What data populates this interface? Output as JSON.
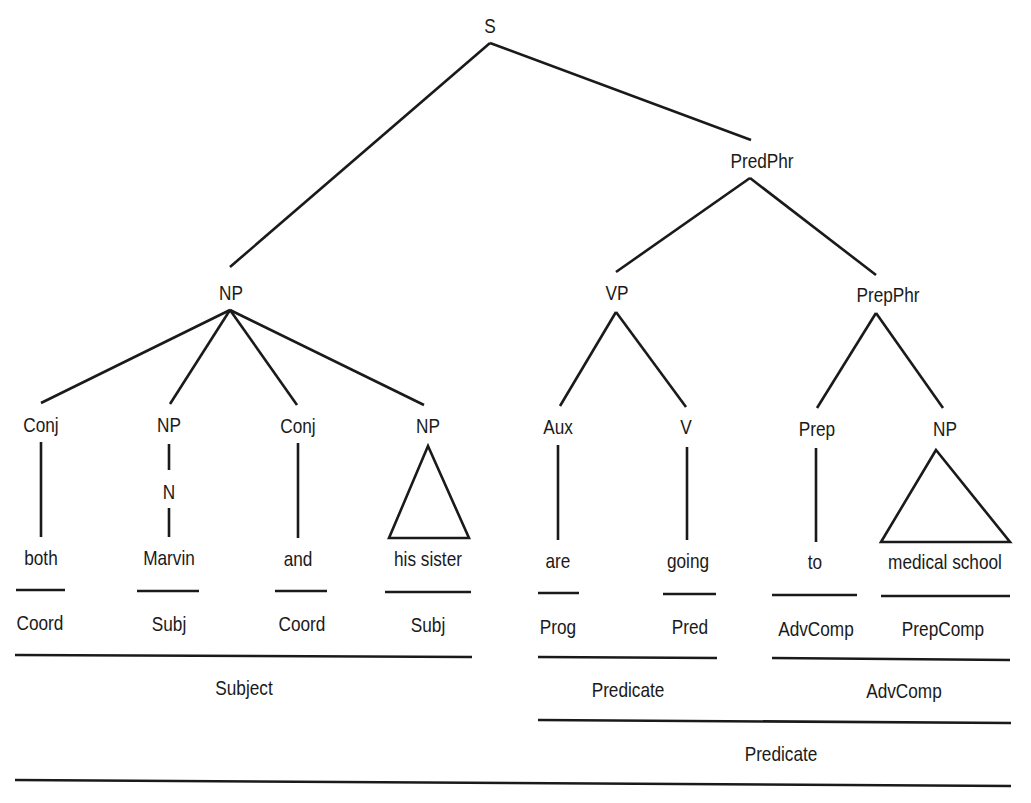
{
  "diagram": {
    "type": "syntax-tree",
    "sentence": "both Marvin and his sister are going to medical school",
    "nodes": {
      "root": "S",
      "np_subject": "NP",
      "pred_phr": "PredPhr",
      "vp": "VP",
      "prep_phr": "PrepPhr",
      "conj1": "Conj",
      "np_marvin": "NP",
      "n_marvin": "N",
      "conj2": "Conj",
      "np_sister": "NP",
      "aux": "Aux",
      "v": "V",
      "prep": "Prep",
      "np_school": "NP"
    },
    "words": {
      "both": "both",
      "marvin": "Marvin",
      "and": "and",
      "his_sister": "his sister",
      "are": "are",
      "going": "going",
      "to": "to",
      "medical_school": "medical school"
    },
    "functions": {
      "both": "Coord",
      "marvin": "Subj",
      "and": "Coord",
      "his_sister": "Subj",
      "are": "Prog",
      "going": "Pred",
      "to": "AdvComp",
      "medical_school": "PrepComp"
    },
    "groups": {
      "subject": "Subject",
      "vp_predicate": "Predicate",
      "advcomp": "AdvComp",
      "predicate": "Predicate"
    }
  }
}
